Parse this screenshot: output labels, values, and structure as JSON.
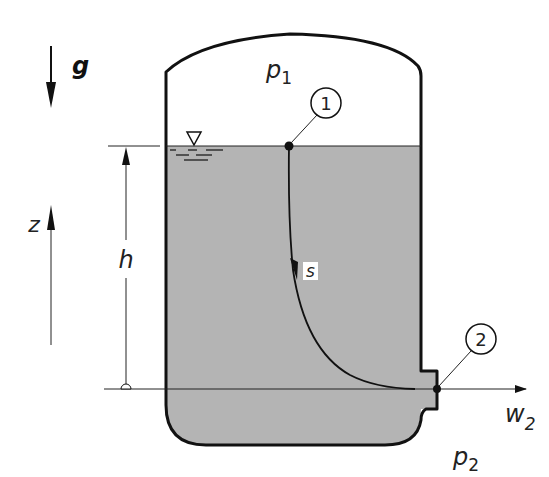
{
  "diagram": {
    "type": "fluid-tank-streamline",
    "colors": {
      "liquid": "#b4b4b4",
      "stroke": "#111111",
      "background": "#ffffff"
    },
    "labels": {
      "gravity": "g",
      "pressure_top": "p",
      "pressure_top_sub": "1",
      "pressure_out": "p",
      "pressure_out_sub": "2",
      "height": "h",
      "vertical_axis": "z",
      "streamline": "s",
      "velocity_out": "w",
      "velocity_out_sub": "2",
      "point_1": "1",
      "point_2": "2"
    },
    "symbols": {
      "free_surface": "free-surface-triangle"
    }
  }
}
